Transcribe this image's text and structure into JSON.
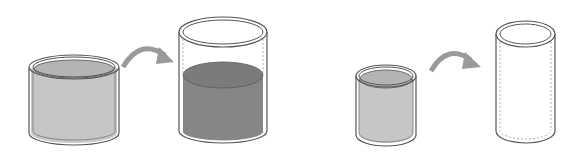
{
  "diagram": {
    "colors": {
      "outline": "#555555",
      "light_liquid": "#c4c4c4",
      "light_liquid_top": "#b2b2b2",
      "dark_liquid": "#858585",
      "dark_liquid_top": "#7a7a7a",
      "arrow": "#9a9a9a",
      "dashed": "#9a9a9a"
    },
    "pairs": [
      {
        "name": "left-pair",
        "source": {
          "name": "wide-short-container",
          "state": "full",
          "liquid": "light"
        },
        "arrow": {
          "name": "pour-arrow-1"
        },
        "target": {
          "name": "tall-wide-container",
          "state": "partially-filled",
          "liquid": "dark"
        }
      },
      {
        "name": "right-pair",
        "source": {
          "name": "narrow-short-container",
          "state": "full",
          "liquid": "light"
        },
        "arrow": {
          "name": "pour-arrow-2"
        },
        "target": {
          "name": "tall-narrow-container",
          "state": "empty",
          "liquid": "none"
        }
      }
    ]
  }
}
